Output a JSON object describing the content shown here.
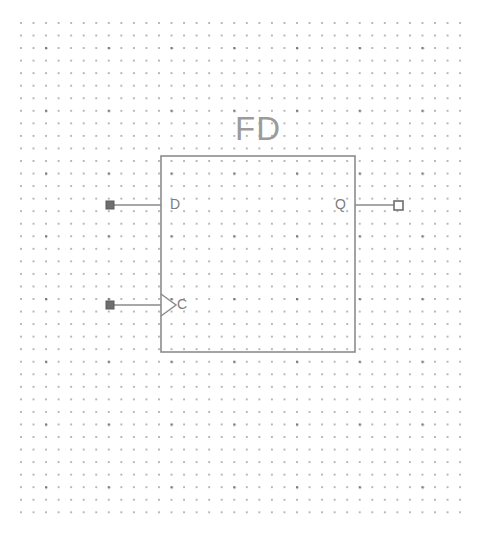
{
  "canvas": {
    "width": 485,
    "height": 545,
    "background_color": "#ffffff",
    "grid": {
      "type": "dot-grid",
      "spacing_px": 12.55,
      "dot_color": "#9a9a9a",
      "major_dot_color": "#4a4a4a",
      "major_every": 5,
      "origin_x": 20,
      "origin_y": 22,
      "width": 451,
      "height": 501
    }
  },
  "symbol": {
    "name": "FD",
    "kind": "d-flip-flop",
    "body": {
      "x": 161,
      "y": 156,
      "width": 194,
      "height": 196,
      "stroke_color": "#8c8c8c",
      "stroke_width": 1.6,
      "fill": "none"
    },
    "pins": [
      {
        "id": "d",
        "label": "D",
        "direction": "input",
        "side": "left",
        "terminal_style": "filled-square",
        "terminal_x": 110,
        "terminal_y": 205,
        "wire_from_x": 113,
        "wire_to_x": 161,
        "wire_y": 205,
        "label_x": 170,
        "label_y": 205,
        "clock": false
      },
      {
        "id": "c",
        "label": "C",
        "direction": "input",
        "side": "left",
        "terminal_style": "filled-square",
        "terminal_x": 110,
        "terminal_y": 305,
        "wire_from_x": 113,
        "wire_to_x": 161,
        "wire_y": 305,
        "label_x": 177,
        "label_y": 305,
        "clock": true,
        "clock_marker": "triangle-right"
      },
      {
        "id": "q",
        "label": "Q",
        "direction": "output",
        "side": "right",
        "terminal_style": "hollow-square",
        "terminal_x": 398,
        "terminal_y": 205,
        "wire_from_x": 355,
        "wire_to_x": 395,
        "wire_y": 205,
        "label_x": 346,
        "label_y": 205,
        "clock": false
      }
    ]
  },
  "colors": {
    "symbol_stroke": "#8c8c8c",
    "symbol_name_text": "#9b9b9b",
    "pin_label_text": "#7d7d7d",
    "wire": "#8a8a8a",
    "terminal_fill_input": "#6e6e6e",
    "terminal_fill_output": "#ffffff",
    "terminal_stroke": "#6e6e6e",
    "grid_dot": "#9a9a9a"
  }
}
